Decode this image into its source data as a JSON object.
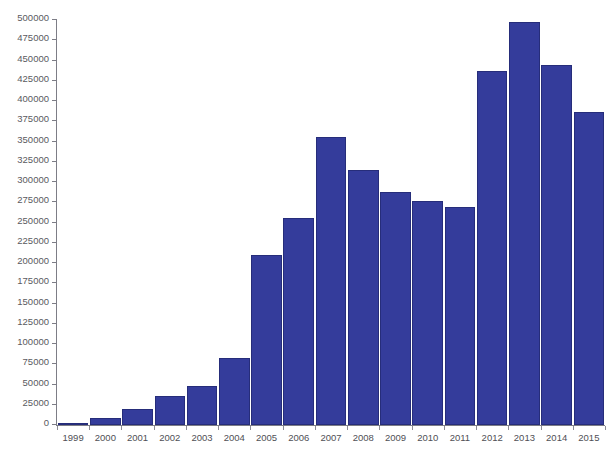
{
  "chart_data": {
    "type": "bar",
    "title": "",
    "subtitle": "",
    "xlabel": "",
    "ylabel": "",
    "categories": [
      "1999",
      "2000",
      "2001",
      "2002",
      "2003",
      "2004",
      "2005",
      "2006",
      "2007",
      "2008",
      "2009",
      "2010",
      "2011",
      "2012",
      "2013",
      "2014",
      "2015"
    ],
    "values": [
      2000,
      9000,
      20000,
      36000,
      48000,
      83000,
      210000,
      255000,
      355000,
      315000,
      288000,
      276000,
      269000,
      437000,
      497000,
      445000,
      386000
    ],
    "ylim": [
      0,
      500000
    ],
    "ytick_step": 25000,
    "ytick_labels": [
      "0",
      "25000",
      "50000",
      "75000",
      "100000",
      "125000",
      "150000",
      "175000",
      "200000",
      "225000",
      "250000",
      "275000",
      "300000",
      "325000",
      "350000",
      "375000",
      "400000",
      "425000",
      "450000",
      "475000",
      "500000"
    ],
    "grid": false,
    "legend": null,
    "bar_color": "#343c9b",
    "bar_edge_color": "#262d7a",
    "axis_color": "#7d7d86",
    "background_color": "#ffffff",
    "annotations": []
  }
}
